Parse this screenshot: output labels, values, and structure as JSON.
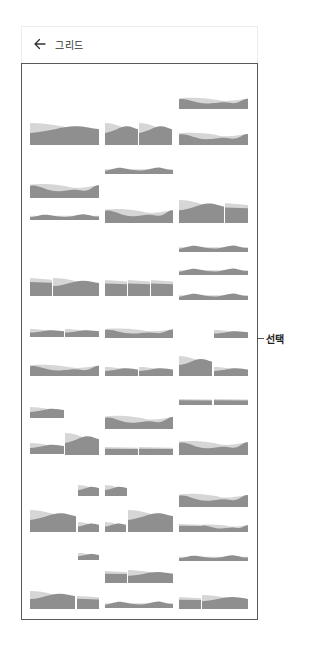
{
  "header": {
    "back_icon": "arrow-left-icon",
    "title": "그리드"
  },
  "annotation": {
    "label": "선택"
  },
  "colors": {
    "thumb_light": "#d6d6d6",
    "thumb_dark": "#8f8f8f",
    "frame_border": "#5a5a5a"
  },
  "thumbnails": [
    {
      "x": 179,
      "y": 97,
      "w": 69,
      "h": 12,
      "style": "wave"
    },
    {
      "x": 30,
      "y": 123,
      "w": 69,
      "h": 22,
      "style": "slope"
    },
    {
      "x": 105,
      "y": 123,
      "w": 33,
      "h": 22,
      "style": "slope"
    },
    {
      "x": 139,
      "y": 123,
      "w": 33,
      "h": 22,
      "style": "slope"
    },
    {
      "x": 179,
      "y": 132,
      "w": 69,
      "h": 13,
      "style": "wave"
    },
    {
      "x": 105,
      "y": 166,
      "w": 68,
      "h": 8,
      "style": "bumps"
    },
    {
      "x": 30,
      "y": 183,
      "w": 69,
      "h": 15,
      "style": "wave"
    },
    {
      "x": 30,
      "y": 213,
      "w": 69,
      "h": 7,
      "style": "bumps"
    },
    {
      "x": 105,
      "y": 208,
      "w": 68,
      "h": 15,
      "style": "wave"
    },
    {
      "x": 179,
      "y": 200,
      "w": 45,
      "h": 23,
      "style": "slope"
    },
    {
      "x": 225,
      "y": 203,
      "w": 23,
      "h": 20,
      "style": "flat"
    },
    {
      "x": 179,
      "y": 244,
      "w": 69,
      "h": 8,
      "style": "bumps"
    },
    {
      "x": 179,
      "y": 267,
      "w": 69,
      "h": 8,
      "style": "bumps"
    },
    {
      "x": 30,
      "y": 278,
      "w": 22,
      "h": 18,
      "style": "flat"
    },
    {
      "x": 53,
      "y": 278,
      "w": 46,
      "h": 18,
      "style": "slope"
    },
    {
      "x": 105,
      "y": 280,
      "w": 22,
      "h": 16,
      "style": "flat"
    },
    {
      "x": 128,
      "y": 280,
      "w": 22,
      "h": 16,
      "style": "flat"
    },
    {
      "x": 151,
      "y": 280,
      "w": 22,
      "h": 16,
      "style": "flat"
    },
    {
      "x": 179,
      "y": 292,
      "w": 69,
      "h": 8,
      "style": "bumps"
    },
    {
      "x": 30,
      "y": 329,
      "w": 34,
      "h": 8,
      "style": "slope"
    },
    {
      "x": 65,
      "y": 329,
      "w": 34,
      "h": 8,
      "style": "slope"
    },
    {
      "x": 105,
      "y": 328,
      "w": 68,
      "h": 10,
      "style": "wave"
    },
    {
      "x": 214,
      "y": 330,
      "w": 34,
      "h": 8,
      "style": "slope"
    },
    {
      "x": 30,
      "y": 364,
      "w": 69,
      "h": 12,
      "style": "wave"
    },
    {
      "x": 105,
      "y": 367,
      "w": 33,
      "h": 9,
      "style": "slope"
    },
    {
      "x": 139,
      "y": 367,
      "w": 34,
      "h": 9,
      "style": "slope"
    },
    {
      "x": 179,
      "y": 356,
      "w": 33,
      "h": 20,
      "style": "slope"
    },
    {
      "x": 214,
      "y": 367,
      "w": 34,
      "h": 9,
      "style": "slope"
    },
    {
      "x": 179,
      "y": 399,
      "w": 33,
      "h": 6,
      "style": "flat"
    },
    {
      "x": 214,
      "y": 399,
      "w": 34,
      "h": 6,
      "style": "flat"
    },
    {
      "x": 30,
      "y": 407,
      "w": 34,
      "h": 11,
      "style": "slope"
    },
    {
      "x": 105,
      "y": 415,
      "w": 68,
      "h": 14,
      "style": "wave"
    },
    {
      "x": 30,
      "y": 443,
      "w": 34,
      "h": 11,
      "style": "slope"
    },
    {
      "x": 65,
      "y": 433,
      "w": 34,
      "h": 22,
      "style": "slope"
    },
    {
      "x": 105,
      "y": 447,
      "w": 33,
      "h": 8,
      "style": "flat"
    },
    {
      "x": 139,
      "y": 447,
      "w": 34,
      "h": 8,
      "style": "flat"
    },
    {
      "x": 179,
      "y": 440,
      "w": 69,
      "h": 15,
      "style": "wave"
    },
    {
      "x": 78,
      "y": 485,
      "w": 21,
      "h": 11,
      "style": "slope"
    },
    {
      "x": 105,
      "y": 485,
      "w": 22,
      "h": 11,
      "style": "slope"
    },
    {
      "x": 179,
      "y": 493,
      "w": 69,
      "h": 14,
      "style": "wave"
    },
    {
      "x": 30,
      "y": 510,
      "w": 46,
      "h": 22,
      "style": "slope"
    },
    {
      "x": 78,
      "y": 522,
      "w": 21,
      "h": 10,
      "style": "slope"
    },
    {
      "x": 105,
      "y": 522,
      "w": 21,
      "h": 10,
      "style": "slope"
    },
    {
      "x": 128,
      "y": 510,
      "w": 45,
      "h": 22,
      "style": "slope"
    },
    {
      "x": 179,
      "y": 524,
      "w": 23,
      "h": 8,
      "style": "flat"
    },
    {
      "x": 202,
      "y": 524,
      "w": 46,
      "h": 8,
      "style": "wave"
    },
    {
      "x": 78,
      "y": 553,
      "w": 21,
      "h": 7,
      "style": "slope"
    },
    {
      "x": 179,
      "y": 554,
      "w": 69,
      "h": 7,
      "style": "bumps"
    },
    {
      "x": 105,
      "y": 571,
      "w": 22,
      "h": 12,
      "style": "flat"
    },
    {
      "x": 128,
      "y": 570,
      "w": 45,
      "h": 13,
      "style": "slope"
    },
    {
      "x": 30,
      "y": 591,
      "w": 45,
      "h": 18,
      "style": "slope"
    },
    {
      "x": 77,
      "y": 596,
      "w": 22,
      "h": 13,
      "style": "flat"
    },
    {
      "x": 105,
      "y": 600,
      "w": 68,
      "h": 8,
      "style": "bumps"
    },
    {
      "x": 179,
      "y": 597,
      "w": 22,
      "h": 12,
      "style": "flat"
    },
    {
      "x": 202,
      "y": 595,
      "w": 46,
      "h": 14,
      "style": "slope"
    }
  ]
}
